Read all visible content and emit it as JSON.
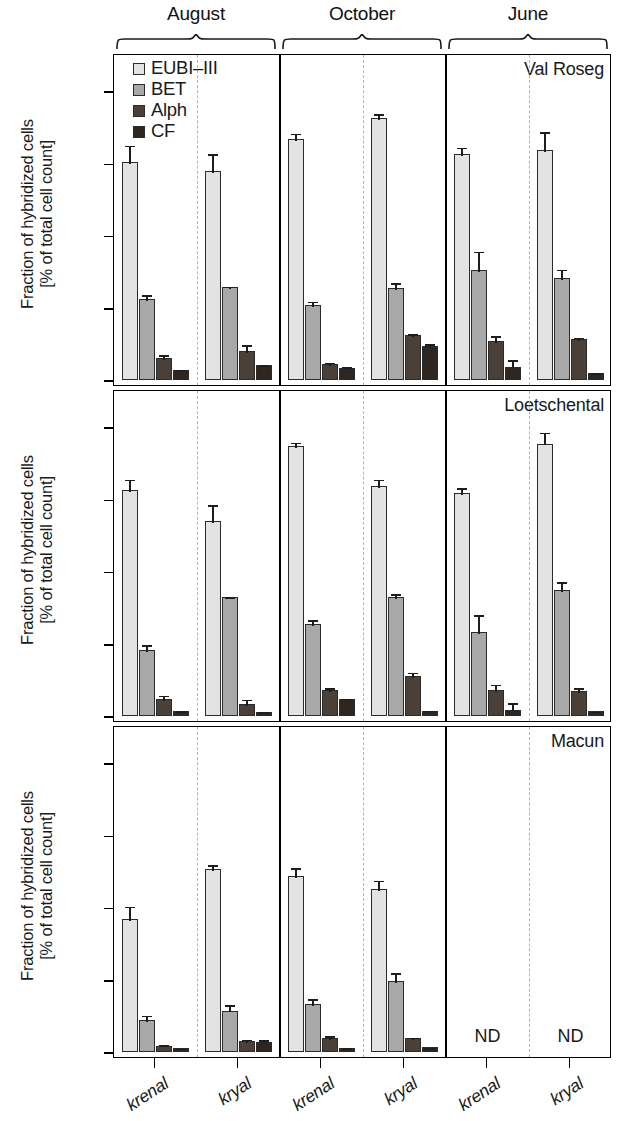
{
  "figure": {
    "y_axis_title_line1": "Fraction of hybridized cells",
    "y_axis_title_line2": "[% of total cell count]",
    "nd_label": "ND",
    "months": [
      "August",
      "October",
      "June"
    ],
    "sites": [
      "krenal",
      "kryal"
    ],
    "panels": [
      "Val Roseg",
      "Loetschental",
      "Macun"
    ]
  },
  "legend": {
    "title": "",
    "items": [
      {
        "label": "EUBI–III",
        "color": "#e3e3e3"
      },
      {
        "label": "BET",
        "color": "#a8a8a8"
      },
      {
        "label": "Alph",
        "color": "#4a4038"
      },
      {
        "label": "CF",
        "color": "#2e2721"
      }
    ]
  },
  "chart_data": {
    "type": "bar",
    "title": "",
    "xlabel": "",
    "ylabel": "Fraction of hybridized cells [% of total cell count]",
    "ylim": [
      0,
      90
    ],
    "yticks": [
      0,
      20,
      40,
      60,
      80
    ],
    "ytick_labels": [
      "0",
      "20",
      "40",
      "60",
      "80"
    ],
    "grid": false,
    "legend_position": "top-left",
    "series_names": [
      "EUBI–III",
      "BET",
      "Alph",
      "CF"
    ],
    "series_colors": [
      "#e3e3e3",
      "#a8a8a8",
      "#4a4038",
      "#2e2721"
    ],
    "group_levels": {
      "panel": [
        "Val Roseg",
        "Loetschental",
        "Macun"
      ],
      "month": [
        "August",
        "October",
        "June"
      ],
      "site": [
        "krenal",
        "kryal"
      ]
    },
    "panels": [
      {
        "name": "Val Roseg",
        "months": [
          {
            "month": "August",
            "sites": [
              {
                "site": "krenal",
                "values": [
                  60.5,
                  22.5,
                  6.2,
                  2.8
                ],
                "errors": [
                  5.0,
                  1.6,
                  1.3,
                  0.6
                ],
                "nd": false
              },
              {
                "site": "kryal",
                "values": [
                  57.8,
                  25.8,
                  8.0,
                  4.2
                ],
                "errors": [
                  5.3,
                  0.6,
                  2.2,
                  0.5
                ],
                "nd": false
              }
            ]
          },
          {
            "month": "October",
            "sites": [
              {
                "site": "krenal",
                "values": [
                  66.8,
                  20.8,
                  4.5,
                  3.3
                ],
                "errors": [
                  2.0,
                  1.5,
                  0.9,
                  0.8
                ],
                "nd": false
              },
              {
                "site": "kryal",
                "values": [
                  72.5,
                  25.6,
                  12.5,
                  9.5
                ],
                "errors": [
                  1.8,
                  1.8,
                  0.7,
                  0.9
                ],
                "nd": false
              }
            ]
          },
          {
            "month": "June",
            "sites": [
              {
                "site": "krenal",
                "values": [
                  62.7,
                  30.5,
                  10.8,
                  3.5
                ],
                "errors": [
                  2.2,
                  5.6,
                  1.9,
                  2.5
                ],
                "nd": false
              },
              {
                "site": "kryal",
                "values": [
                  63.8,
                  28.2,
                  11.3,
                  2.0
                ],
                "errors": [
                  5.5,
                  2.9,
                  1.0,
                  0.4
                ],
                "nd": false
              }
            ]
          }
        ]
      },
      {
        "name": "Loetschental",
        "months": [
          {
            "month": "August",
            "sites": [
              {
                "site": "krenal",
                "values": [
                  62.5,
                  18.4,
                  4.8,
                  1.4
                ],
                "errors": [
                  3.5,
                  1.8,
                  1.4,
                  0.5
                ],
                "nd": false
              },
              {
                "site": "kryal",
                "values": [
                  54.0,
                  33.0,
                  3.4,
                  1.2
                ],
                "errors": [
                  5.0,
                  0.5,
                  1.7,
                  0.4
                ],
                "nd": false
              }
            ]
          },
          {
            "month": "October",
            "sites": [
              {
                "site": "krenal",
                "values": [
                  74.8,
                  25.6,
                  7.2,
                  4.6
                ],
                "errors": [
                  1.5,
                  1.6,
                  1.1,
                  0.8
                ],
                "nd": false
              },
              {
                "site": "kryal",
                "values": [
                  63.8,
                  33.0,
                  11.0,
                  1.5
                ],
                "errors": [
                  2.2,
                  1.4,
                  1.6,
                  0.5
                ],
                "nd": false
              }
            ]
          },
          {
            "month": "June",
            "sites": [
              {
                "site": "krenal",
                "values": [
                  61.8,
                  23.2,
                  7.2,
                  1.8
                ],
                "errors": [
                  1.9,
                  5.2,
                  2.0,
                  2.3
                ],
                "nd": false
              },
              {
                "site": "kryal",
                "values": [
                  75.5,
                  35.0,
                  7.0,
                  1.4
                ],
                "errors": [
                  3.6,
                  2.6,
                  1.3,
                  0.4
                ],
                "nd": false
              }
            ]
          }
        ]
      },
      {
        "name": "Macun",
        "months": [
          {
            "month": "August",
            "sites": [
              {
                "site": "krenal",
                "values": [
                  36.8,
                  8.8,
                  1.8,
                  1.1
                ],
                "errors": [
                  4.0,
                  1.8,
                  0.6,
                  0.4
                ],
                "nd": false
              },
              {
                "site": "kryal",
                "values": [
                  50.8,
                  11.5,
                  3.0,
                  2.8
                ],
                "errors": [
                  1.5,
                  2.0,
                  1.0,
                  1.0
                ],
                "nd": false
              }
            ]
          },
          {
            "month": "October",
            "sites": [
              {
                "site": "krenal",
                "values": [
                  48.8,
                  13.2,
                  3.8,
                  1.2
                ],
                "errors": [
                  2.6,
                  2.0,
                  1.1,
                  0.4
                ],
                "nd": false
              },
              {
                "site": "kryal",
                "values": [
                  45.2,
                  19.8,
                  3.8,
                  1.3
                ],
                "errors": [
                  2.8,
                  2.6,
                  0.7,
                  0.4
                ],
                "nd": false
              }
            ]
          },
          {
            "month": "June",
            "sites": [
              {
                "site": "krenal",
                "values": [],
                "errors": [],
                "nd": true
              },
              {
                "site": "kryal",
                "values": [],
                "errors": [],
                "nd": true
              }
            ]
          }
        ]
      }
    ]
  }
}
